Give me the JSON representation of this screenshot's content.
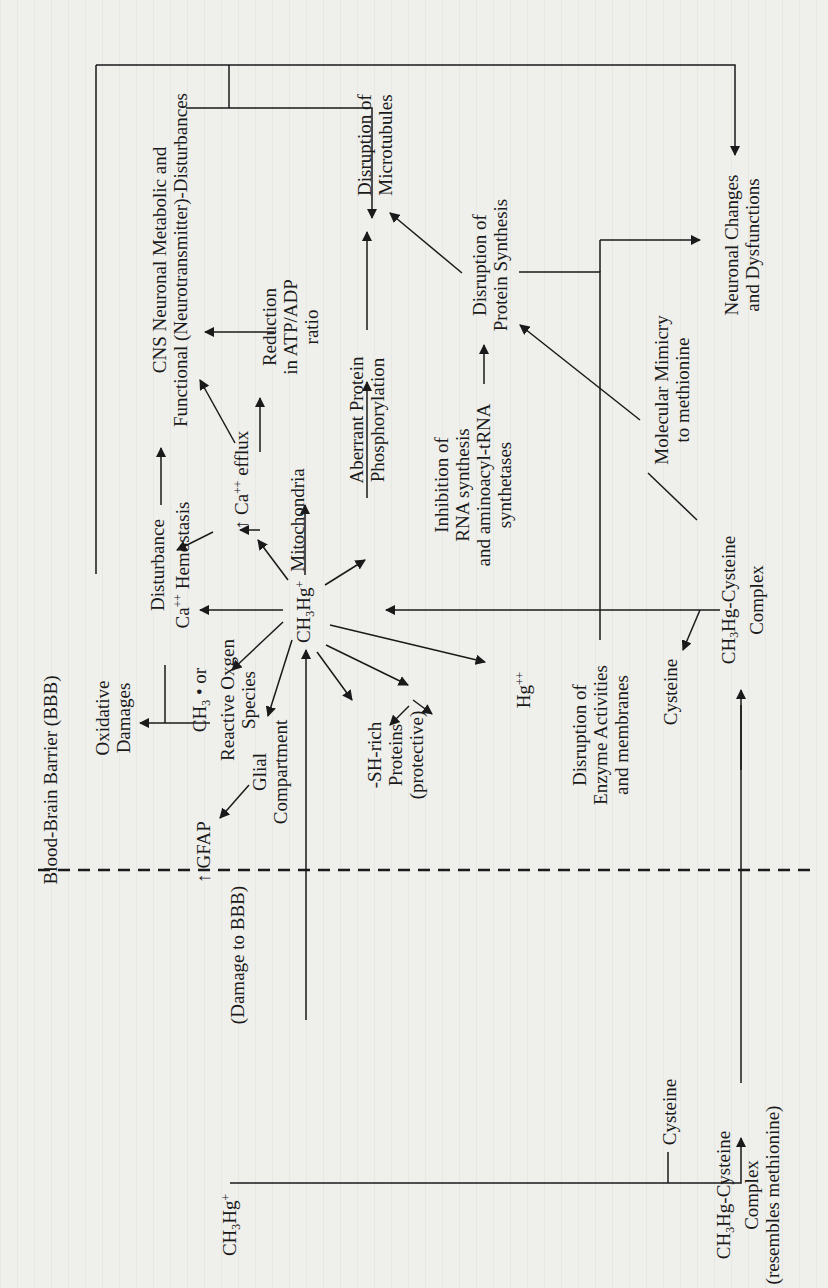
{
  "figure": {
    "orientation": "rotated-90-ccw",
    "barrier_label": "Blood-Brain Barrier (BBB)",
    "nodes": {
      "central": {
        "pre": "CH",
        "sub": "3",
        "mid": "Hg",
        "sup": "+"
      },
      "blood_mehg": {
        "pre": "CH",
        "sub": "3",
        "mid": "Hg",
        "sup": "+"
      },
      "blood_cysteine": "Cysteine",
      "blood_complex_1": {
        "pre": "CH",
        "sub": "3",
        "post": "Hg-Cysteine"
      },
      "blood_complex_2": "Complex",
      "blood_complex_3": "(resembles methionine)",
      "damage_bbb": "(Damage to BBB)",
      "gfap": "↑ GFAP",
      "glial_1": "Glial",
      "glial_2": "Compartment",
      "oxidative_1": "Oxidative",
      "oxidative_2": "Damages",
      "ros_1": {
        "pre": "CH",
        "sub": "3",
        "post": " • or"
      },
      "ros_2": "Reactive Oxgen",
      "ros_3": "Species",
      "sh_1": "-SH-rich",
      "sh_2": "Proteins",
      "sh_3": "(protective)",
      "hg2": {
        "pre": "Hg",
        "sup": "++"
      },
      "enzyme_1": "Disruption of",
      "enzyme_2": "Enzyme Activities",
      "enzyme_3": "and membranes",
      "brain_cysteine": "Cysteine",
      "brain_complex_1": {
        "pre": "CH",
        "sub": "3",
        "post": "Hg-Cysteine"
      },
      "brain_complex_2": "Complex",
      "ca_hemo_1": "Disturbance",
      "ca_hemo_2": {
        "pre": "Ca",
        "sup": "++",
        "post": " Hemostasis"
      },
      "ca_efflux": {
        "pre": "↑ Ca",
        "sup": "++",
        "post": " efflux"
      },
      "mitochondria": "Mitochondria",
      "atp_1": "Reduction",
      "atp_2": "in ATP/ADP",
      "atp_3": "ratio",
      "cns_1": "CNS Neuronal Metabolic and",
      "cns_2": "Functional (Neurotransmitter)-Disturbances",
      "aberrant_1": "Aberrant Protein",
      "aberrant_2": "Phosphorylation",
      "inhib_1": "Inhibition of",
      "inhib_2": "RNA synthesis",
      "inhib_3": "and aminoacyl-tRNA",
      "inhib_4": "synthetases",
      "microtub_1": "Disruption of",
      "microtub_2": "Microtubules",
      "protsyn_1": "Disruption of",
      "protsyn_2": "Protein Synthesis",
      "mimicry_1": "Molecular Mimicry",
      "mimicry_2": "to methionine",
      "neuronal_1": "Neuronal Changes",
      "neuronal_2": "and Dysfunctions"
    }
  },
  "colors": {
    "paper": "#efefec",
    "ink": "#1a1a1a",
    "bleed_through": "#d9d9d4"
  }
}
